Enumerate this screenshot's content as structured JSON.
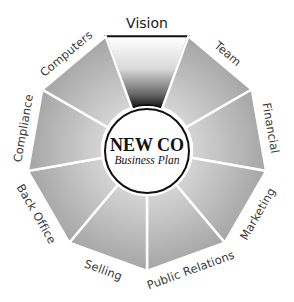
{
  "diagram": {
    "type": "radial-wheel",
    "center": {
      "title": "NEW CO",
      "subtitle": "Business Plan"
    },
    "highlighted_segment": "Vision",
    "colors": {
      "segment_outer": "#a6a6a6",
      "segment_inner": "#d4d4d4",
      "highlight_top": "#ffffff",
      "highlight_bottom": "#1a1a1a",
      "divider": "#ffffff",
      "circle_stroke": "#111111"
    },
    "segments": [
      {
        "label": "Vision"
      },
      {
        "label": "Team"
      },
      {
        "label": "Financial"
      },
      {
        "label": "Marketing"
      },
      {
        "label": "Public Relations"
      },
      {
        "label": "Selling"
      },
      {
        "label": "Back Office"
      },
      {
        "label": "Compliance"
      },
      {
        "label": "Computers"
      }
    ]
  }
}
